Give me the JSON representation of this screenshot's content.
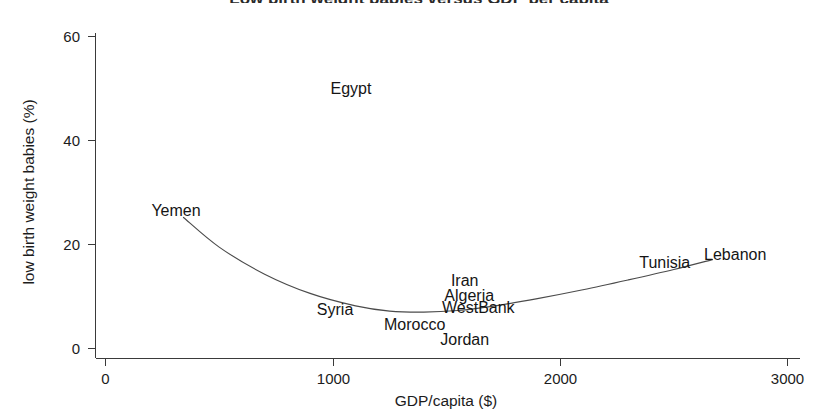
{
  "figure": {
    "background_color": "#ffffff",
    "line_color": "#4b4b4b",
    "axis_color": "#3a3a3a",
    "text_color": "#151515",
    "title_clipped": "Low birth weight babies versus GDP per capita"
  },
  "chart_data": {
    "type": "scatter",
    "title": "",
    "xlabel": "GDP/capita ($)",
    "ylabel": "low birth weight babies (%)",
    "xlim": [
      0,
      3000
    ],
    "ylim": [
      0,
      65
    ],
    "grid": false,
    "legend": false,
    "xticks": [
      0,
      1000,
      2000,
      3000
    ],
    "xtick_labels": [
      "0",
      "1000",
      "2000",
      "3000"
    ],
    "yticks": [
      0,
      20,
      40,
      60
    ],
    "ytick_labels": [
      "0",
      "20",
      "40",
      "60"
    ],
    "point_labels": [
      {
        "name": "Egypt",
        "x": 1080,
        "y": 50.0
      },
      {
        "name": "Yemen",
        "x": 310,
        "y": 26.5
      },
      {
        "name": "Lebanon",
        "x": 2770,
        "y": 18.0
      },
      {
        "name": "Tunisia",
        "x": 2460,
        "y": 16.5
      },
      {
        "name": "Iran",
        "x": 1580,
        "y": 13.0
      },
      {
        "name": "Algeria",
        "x": 1600,
        "y": 10.2
      },
      {
        "name": "Syria",
        "x": 1010,
        "y": 7.5
      },
      {
        "name": "WestBank",
        "x": 1640,
        "y": 7.8
      },
      {
        "name": "Morocco",
        "x": 1360,
        "y": 4.5
      },
      {
        "name": "Jordan",
        "x": 1580,
        "y": 1.7
      }
    ],
    "fitted_curve": {
      "description": "u-shaped fitted trend line",
      "points": [
        {
          "x": 343,
          "y": 25.2
        },
        {
          "x": 500,
          "y": 19.5
        },
        {
          "x": 700,
          "y": 14.3
        },
        {
          "x": 900,
          "y": 10.6
        },
        {
          "x": 1100,
          "y": 8.2
        },
        {
          "x": 1250,
          "y": 7.2
        },
        {
          "x": 1400,
          "y": 7.0
        },
        {
          "x": 1550,
          "y": 7.3
        },
        {
          "x": 1700,
          "y": 8.1
        },
        {
          "x": 1900,
          "y": 9.6
        },
        {
          "x": 2100,
          "y": 11.3
        },
        {
          "x": 2300,
          "y": 13.2
        },
        {
          "x": 2500,
          "y": 15.2
        },
        {
          "x": 2670,
          "y": 17.1
        }
      ]
    }
  }
}
